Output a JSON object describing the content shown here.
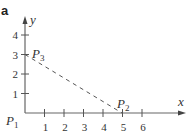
{
  "panel_label": "a",
  "axes": {
    "x_label": "x",
    "y_label": "y",
    "x_ticks": [
      "1",
      "2",
      "3",
      "4",
      "5",
      "6"
    ],
    "y_ticks": [
      "1",
      "2",
      "3",
      "4"
    ]
  },
  "points": {
    "p1": {
      "label": "P",
      "sub": "1",
      "x": 0,
      "y": 0
    },
    "p2": {
      "label": "P",
      "sub": "2",
      "x": 5,
      "y": 0
    },
    "p3": {
      "label": "P",
      "sub": "3",
      "x": 0,
      "y": 3
    }
  },
  "segments": [
    {
      "from": "P3",
      "to": "P2",
      "style": "dashed"
    }
  ],
  "colors": {
    "ink": "#333333",
    "axis": "#555555"
  }
}
